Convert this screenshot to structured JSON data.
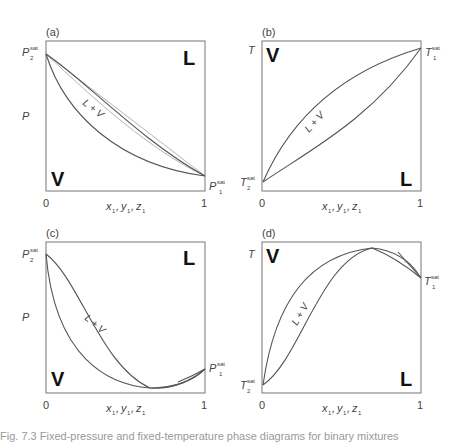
{
  "figure": {
    "panels": [
      {
        "id": "a",
        "label": "(a)",
        "y_symbol": "P",
        "top_left_sat": {
          "base": "P",
          "sup": "sat",
          "sub": "2"
        },
        "right_sat": {
          "base": "P",
          "sup": "sat",
          "sub": "1"
        },
        "top_right_phase": "L",
        "bottom_left_phase": "V",
        "region_label": "L + V",
        "x_tick_0": "0",
        "x_tick_1": "1",
        "x_label": {
          "x": "x",
          "y": "y",
          "z": "z",
          "sub": "1"
        }
      },
      {
        "id": "b",
        "label": "(b)",
        "y_symbol": "T",
        "left_sat": {
          "base": "T",
          "sup": "sat",
          "sub": "2"
        },
        "top_right_sat": {
          "base": "T",
          "sup": "sat",
          "sub": "1"
        },
        "top_left_phase": "V",
        "bottom_right_phase": "L",
        "region_label": "L + V",
        "x_tick_0": "0",
        "x_tick_1": "1",
        "x_label": {
          "x": "x",
          "y": "y",
          "z": "z",
          "sub": "1"
        }
      },
      {
        "id": "c",
        "label": "(c)",
        "y_symbol": "P",
        "top_left_sat": {
          "base": "P",
          "sup": "sat",
          "sub": "2"
        },
        "right_sat": {
          "base": "P",
          "sup": "sat",
          "sub": "1"
        },
        "top_right_phase": "L",
        "bottom_left_phase": "V",
        "region_label": "L + V",
        "small_region_label": "L + V",
        "x_tick_0": "0",
        "x_tick_1": "1",
        "x_label": {
          "x": "x",
          "y": "y",
          "z": "z",
          "sub": "1"
        }
      },
      {
        "id": "d",
        "label": "(d)",
        "y_symbol": "T",
        "left_sat": {
          "base": "T",
          "sup": "sat",
          "sub": "2"
        },
        "right_sat": {
          "base": "T",
          "sup": "sat",
          "sub": "1"
        },
        "top_left_phase": "V",
        "bottom_right_phase": "L",
        "region_label": "L + V",
        "small_region_label": "L + V",
        "x_tick_0": "0",
        "x_tick_1": "1",
        "x_label": {
          "x": "x",
          "y": "y",
          "z": "z",
          "sub": "1"
        }
      }
    ],
    "caption_fragment": "Fig. 7.3   Fixed-pressure and fixed-temperature phase diagrams for binary mixtures"
  },
  "colors": {
    "frame": "#777777",
    "curve": "#555555",
    "reference_line": "#aaaaaa",
    "phase_text": "#111111"
  }
}
